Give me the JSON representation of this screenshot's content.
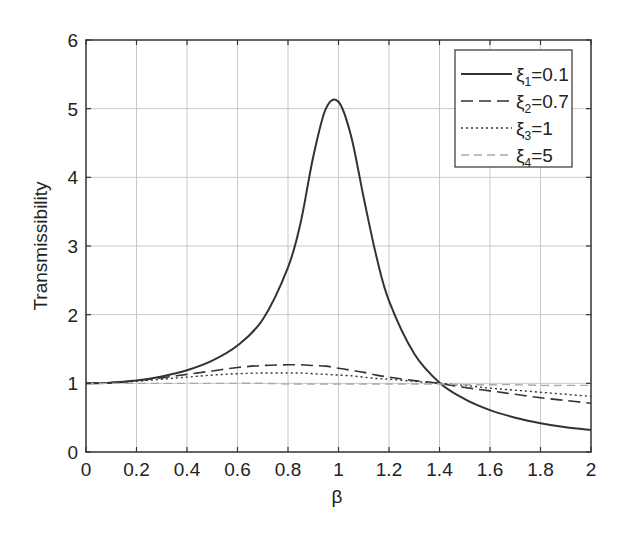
{
  "chart_data": {
    "type": "line",
    "title": "",
    "xlabel": "β",
    "ylabel": "Transmissibility",
    "xlim": [
      0,
      2
    ],
    "ylim": [
      0,
      6
    ],
    "xticks": [
      "0",
      "0.2",
      "0.4",
      "0.6",
      "0.8",
      "1",
      "1.2",
      "1.4",
      "1.6",
      "1.8",
      "2"
    ],
    "yticks": [
      "0",
      "1",
      "2",
      "3",
      "4",
      "5",
      "6"
    ],
    "grid": true,
    "legend_position": "upper right",
    "x": [
      0,
      0.1,
      0.2,
      0.3,
      0.4,
      0.5,
      0.6,
      0.7,
      0.8,
      0.85,
      0.9,
      0.95,
      1.0,
      1.05,
      1.1,
      1.15,
      1.2,
      1.3,
      1.4,
      1.5,
      1.6,
      1.7,
      1.8,
      1.9,
      2.0
    ],
    "series": [
      {
        "name": "ξ1=0.1",
        "style": "solid",
        "values": [
          1.0,
          1.01,
          1.04,
          1.1,
          1.19,
          1.33,
          1.55,
          1.93,
          2.69,
          3.34,
          4.3,
          5.0,
          5.1,
          4.6,
          3.7,
          2.85,
          2.2,
          1.43,
          1.01,
          0.77,
          0.61,
          0.5,
          0.42,
          0.36,
          0.32
        ]
      },
      {
        "name": "ξ2=0.7",
        "style": "dashed",
        "values": [
          1.0,
          1.01,
          1.04,
          1.08,
          1.13,
          1.18,
          1.23,
          1.26,
          1.27,
          1.27,
          1.26,
          1.25,
          1.22,
          1.19,
          1.16,
          1.12,
          1.09,
          1.04,
          1.0,
          0.94,
          0.89,
          0.84,
          0.79,
          0.75,
          0.71
        ]
      },
      {
        "name": "ξ3=1",
        "style": "dotted",
        "values": [
          1.0,
          1.01,
          1.03,
          1.06,
          1.09,
          1.12,
          1.14,
          1.15,
          1.15,
          1.15,
          1.14,
          1.13,
          1.12,
          1.11,
          1.09,
          1.07,
          1.06,
          1.03,
          1.0,
          0.97,
          0.93,
          0.9,
          0.87,
          0.84,
          0.81
        ]
      },
      {
        "name": "ξ4=5",
        "style": "dashed-light",
        "values": [
          1.0,
          1.0,
          1.0,
          1.0,
          1.0,
          1.0,
          1.0,
          1.0,
          0.99,
          0.99,
          0.99,
          0.99,
          0.99,
          0.99,
          0.99,
          0.99,
          0.99,
          0.99,
          0.99,
          0.98,
          0.98,
          0.98,
          0.97,
          0.97,
          0.97
        ]
      }
    ]
  },
  "legend": {
    "items": [
      {
        "sym": "ξ",
        "sub": "1",
        "val": "=0.1"
      },
      {
        "sym": "ξ",
        "sub": "2",
        "val": "=0.7"
      },
      {
        "sym": "ξ",
        "sub": "3",
        "val": "=1"
      },
      {
        "sym": "ξ",
        "sub": "4",
        "val": "=5"
      }
    ]
  },
  "colors": {
    "line": "#333333",
    "grid": "#c8c8c8",
    "axis": "#333333",
    "light_line": "#aaaaaa"
  }
}
